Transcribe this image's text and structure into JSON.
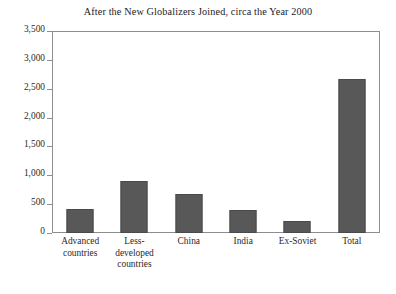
{
  "chart_data": {
    "type": "bar",
    "title": "After the New Globalizers Joined, circa the Year 2000",
    "xlabel": "",
    "ylabel": "",
    "ylim": [
      0,
      3500
    ],
    "grid": false,
    "legend": "none",
    "bar_color": "#585858",
    "frame_color": "#8d8d8d",
    "ytick_labels": [
      "0",
      "500",
      "1,000",
      "1,500",
      "2,000",
      "2,500",
      "3,000",
      "3,500"
    ],
    "ytick_values": [
      0,
      500,
      1000,
      1500,
      2000,
      2500,
      3000,
      3500
    ],
    "categories": [
      "Advanced countries",
      "Less-developed countries",
      "China",
      "India",
      "Ex-Soviet",
      "Total"
    ],
    "category_lines": [
      [
        "Advanced",
        "countries"
      ],
      [
        "Less-",
        "developed",
        "countries"
      ],
      [
        "China"
      ],
      [
        "India"
      ],
      [
        "Ex-Soviet"
      ],
      [
        "Total"
      ]
    ],
    "values": [
      420,
      910,
      680,
      400,
      215,
      2690
    ]
  }
}
